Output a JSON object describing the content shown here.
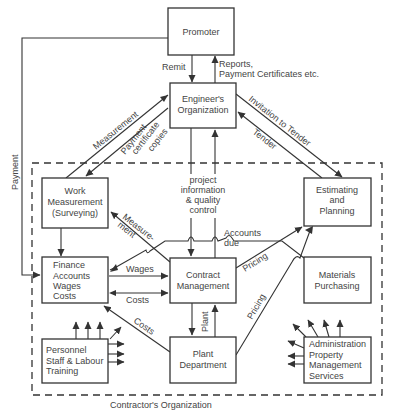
{
  "diagram": {
    "boxes": {
      "promoter": {
        "label": [
          "Promoter"
        ]
      },
      "engineer": {
        "label": [
          "Engineer's",
          "Organization"
        ]
      },
      "work_measurement": {
        "label": [
          "Work",
          "Measurement",
          "(Surveying)"
        ]
      },
      "estimating": {
        "label": [
          "Estimating",
          "and",
          "Planning"
        ]
      },
      "finance": {
        "label": [
          "Finance",
          "Accounts",
          "Wages",
          "Costs"
        ]
      },
      "contract": {
        "label": [
          "Contract",
          "Management"
        ]
      },
      "materials": {
        "label": [
          "Materials",
          "Purchasing"
        ]
      },
      "personnel": {
        "label": [
          "Personnel",
          "Staff & Labour",
          "Training"
        ]
      },
      "plant": {
        "label": [
          "Plant",
          "Department"
        ]
      },
      "administration": {
        "label": [
          "Administration",
          "Property",
          "Management",
          "Services"
        ]
      }
    },
    "edges": {
      "remit": "Remit",
      "reports": [
        "Reports,",
        "Payment Certificates etc."
      ],
      "measurement": "Measurement",
      "payment_cert": [
        "Payment",
        "certificate",
        "copies"
      ],
      "invitation": "Invitation to Tender",
      "tender": "Tender",
      "payment": "Payment",
      "project_info": [
        "project",
        "information",
        "& quality",
        "control"
      ],
      "measurement2": [
        "Measure-",
        "ment"
      ],
      "accounts_due": [
        "Accounts",
        "due"
      ],
      "pricing1": "Pricing",
      "pricing2": "Pricing",
      "wages": "Wages",
      "costs1": "Costs",
      "costs2": "Costs",
      "plant": "Plant"
    },
    "boundary_label": "Contractor's Organization"
  }
}
